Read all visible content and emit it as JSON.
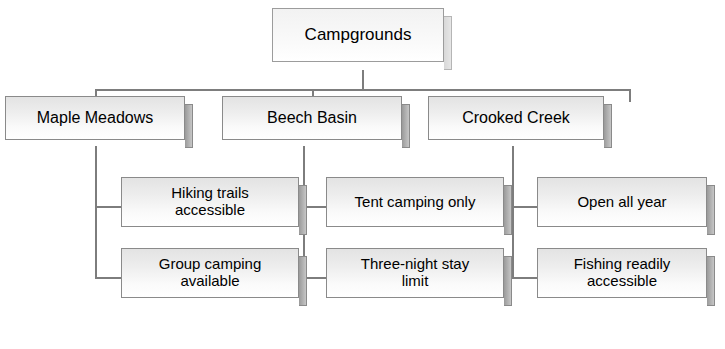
{
  "diagram": {
    "title": "Campgrounds",
    "root": {
      "label": "Campgrounds"
    },
    "branches": [
      {
        "label": "Maple Meadows",
        "children": [
          {
            "label": "Hiking trails\naccessible"
          },
          {
            "label": "Group camping\navailable"
          }
        ]
      },
      {
        "label": "Beech Basin",
        "children": [
          {
            "label": "Tent camping only"
          },
          {
            "label": "Three-night stay\nlimit"
          }
        ]
      },
      {
        "label": "Crooked Creek",
        "children": [
          {
            "label": "Open all year"
          },
          {
            "label": "Fishing readily\naccessible"
          }
        ]
      }
    ],
    "colors": {
      "background": "#ffffff",
      "box_fill_light": "#ffffff",
      "box_fill_dark": "#e3e3e3",
      "box_border": "#8a8a8a",
      "bevel": "#b4b4b4",
      "connector": "#7d7d7d",
      "text": "#000000"
    }
  }
}
